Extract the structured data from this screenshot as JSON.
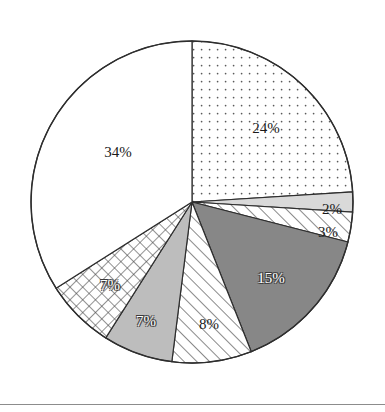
{
  "chart_data": {
    "type": "pie",
    "title": "",
    "subtitle": "",
    "xlabel": "",
    "ylabel": "",
    "legend_position": "none",
    "grid": false,
    "labels_are_percent": true,
    "start_angle_deg": 0,
    "direction": "clockwise",
    "center": {
      "x": 192,
      "y": 202
    },
    "radius": 161,
    "outline_color": "#2e2e2e",
    "categories": [
      "Slice 1",
      "Slice 2",
      "Slice 3",
      "Slice 4",
      "Slice 5",
      "Slice 6",
      "Slice 7",
      "Slice 8"
    ],
    "values": [
      24,
      2,
      3,
      15,
      8,
      7,
      7,
      34
    ],
    "slices": [
      {
        "label": "24%",
        "value": 24,
        "fill_style": "dotted",
        "fill_color": "#ffffff",
        "pattern_color": "#5a5a5a",
        "label_color": "dark",
        "label_x": 266,
        "label_y": 128,
        "label_font_size": 15
      },
      {
        "label": "2%",
        "value": 2,
        "fill_style": "solid",
        "fill_color": "#d9d9d9",
        "pattern_color": "#d9d9d9",
        "label_color": "dark",
        "label_x": 332,
        "label_y": 209,
        "label_font_size": 15
      },
      {
        "label": "3%",
        "value": 3,
        "fill_style": "hatch",
        "fill_color": "#ffffff",
        "pattern_color": "#4a4a4a",
        "label_color": "dark",
        "label_x": 328,
        "label_y": 232,
        "label_font_size": 15
      },
      {
        "label": "15%",
        "value": 15,
        "fill_style": "solid",
        "fill_color": "#878787",
        "pattern_color": "#878787",
        "label_color": "light",
        "label_x": 271,
        "label_y": 278,
        "label_font_size": 15
      },
      {
        "label": "8%",
        "value": 8,
        "fill_style": "hatch",
        "fill_color": "#ffffff",
        "pattern_color": "#4a4a4a",
        "label_color": "dark",
        "label_x": 209,
        "label_y": 324,
        "label_font_size": 15
      },
      {
        "label": "7%",
        "value": 7,
        "fill_style": "solid",
        "fill_color": "#bdbdbd",
        "pattern_color": "#bdbdbd",
        "label_color": "light",
        "label_x": 146,
        "label_y": 321,
        "label_font_size": 15
      },
      {
        "label": "7%",
        "value": 7,
        "fill_style": "crosshatch",
        "fill_color": "#ffffff",
        "pattern_color": "#4a4a4a",
        "label_color": "light",
        "label_x": 110,
        "label_y": 285,
        "label_font_size": 15
      },
      {
        "label": "34%",
        "value": 34,
        "fill_style": "solid",
        "fill_color": "#ffffff",
        "pattern_color": "#ffffff",
        "label_color": "dark",
        "label_x": 118,
        "label_y": 152,
        "label_font_size": 15
      }
    ]
  },
  "footer": {
    "rule_y": 404,
    "rule_color": "#8c8c8c"
  }
}
